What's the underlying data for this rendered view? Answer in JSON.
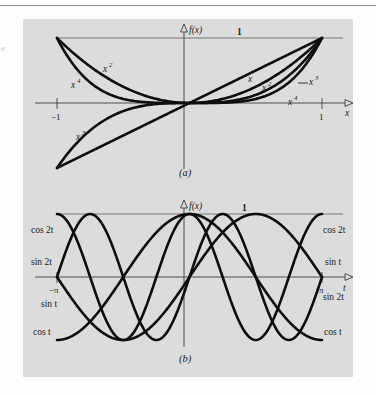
{
  "figure": {
    "background_color": "#dcdcdc",
    "page_color": "#fefefe",
    "curve_color": "#0d0d0d",
    "axis_color": "#3c3c3c",
    "margin_mark": "e"
  },
  "panel_a": {
    "caption": "(a)",
    "y_axis_label": "f(x)",
    "x_axis_label": "x",
    "unit_label": "1",
    "x_ticks": [
      {
        "label": "−1",
        "value": -1
      },
      {
        "label": "1",
        "value": 1
      }
    ],
    "curve_labels": [
      {
        "base": "x",
        "exp": "2",
        "side": "left"
      },
      {
        "base": "x",
        "exp": "4",
        "side": "left"
      },
      {
        "base": "x",
        "exp": "3",
        "side": "left"
      },
      {
        "base": "x",
        "exp": "",
        "side": "right"
      },
      {
        "base": "x",
        "exp": "2",
        "side": "right"
      },
      {
        "base": "x",
        "exp": "3",
        "side": "right"
      },
      {
        "base": "x",
        "exp": "4",
        "side": "right"
      }
    ]
  },
  "panel_b": {
    "caption": "(b)",
    "y_axis_label": "f(x)",
    "x_axis_label": "t",
    "unit_label": "1",
    "x_ticks": [
      {
        "label": "−π",
        "value": -3.14159
      },
      {
        "label": "π",
        "value": 3.14159
      }
    ],
    "left_labels": [
      "cos 2t",
      "sin 2t",
      "sin t",
      "cos t"
    ],
    "right_labels": [
      "cos 2t",
      "sin t",
      "sin 2t",
      "cos t"
    ]
  },
  "chart_data": [
    {
      "type": "line",
      "panel": "a",
      "title": "(a)",
      "xlabel": "x",
      "ylabel": "f(x)",
      "xlim": [
        -1,
        1
      ],
      "ylim": [
        -1,
        1
      ],
      "grid": false,
      "legend": "inline-curve-labels",
      "annotations": [
        "1"
      ],
      "series": [
        {
          "name": "x",
          "expr": "x",
          "label": "x"
        },
        {
          "name": "x^2",
          "expr": "x*x",
          "label": "x²"
        },
        {
          "name": "x^3",
          "expr": "x*x*x",
          "label": "x³"
        },
        {
          "name": "x^4",
          "expr": "x*x*x*x",
          "label": "x⁴"
        }
      ]
    },
    {
      "type": "line",
      "panel": "b",
      "title": "(b)",
      "xlabel": "t",
      "ylabel": "f(x)",
      "xlim": [
        -3.14159,
        3.14159
      ],
      "ylim": [
        -1,
        1
      ],
      "grid": false,
      "legend": "inline-curve-labels",
      "annotations": [
        "1"
      ],
      "series": [
        {
          "name": "sin t",
          "expr": "sin(t)",
          "label": "sin t"
        },
        {
          "name": "cos t",
          "expr": "cos(t)",
          "label": "cos t"
        },
        {
          "name": "sin 2t",
          "expr": "sin(2t)",
          "label": "sin 2t"
        },
        {
          "name": "cos 2t",
          "expr": "cos(2t)",
          "label": "cos 2t"
        }
      ]
    }
  ]
}
